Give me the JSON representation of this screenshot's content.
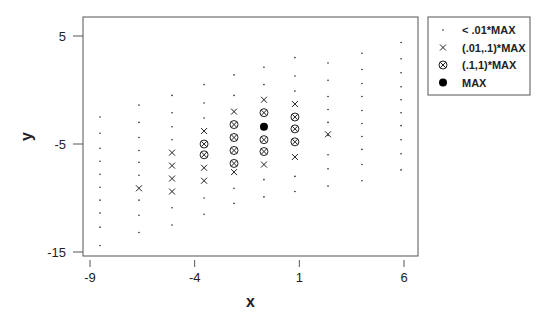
{
  "chart_data": {
    "type": "scatter",
    "title": "",
    "xlabel": "x",
    "ylabel": "y",
    "xlim": [
      -9.3,
      6.6
    ],
    "ylim": [
      -15.4,
      6.8
    ],
    "xticks": [
      -9,
      -4,
      1,
      6
    ],
    "yticks": [
      5,
      -5,
      -15
    ],
    "grid": false,
    "legend_position": "outside-top-right",
    "legend": [
      {
        "symbol": "dot",
        "label": "< .01*MAX"
      },
      {
        "symbol": "cross",
        "label": "(.01,.1)*MAX"
      },
      {
        "symbol": "circle-cross",
        "label": "(.1,1)*MAX"
      },
      {
        "symbol": "filled-circle",
        "label": "MAX"
      }
    ],
    "series": [
      {
        "name": "< .01*MAX",
        "symbol": "dot",
        "points": [
          [
            -8.52,
            -2.5
          ],
          [
            -8.52,
            -4.0
          ],
          [
            -8.52,
            -5.4
          ],
          [
            -8.52,
            -6.6
          ],
          [
            -8.52,
            -7.8
          ],
          [
            -8.52,
            -9.0
          ],
          [
            -8.52,
            -10.2
          ],
          [
            -8.52,
            -11.4
          ],
          [
            -8.52,
            -12.7
          ],
          [
            -8.52,
            -14.4
          ],
          [
            -6.66,
            -1.4
          ],
          [
            -6.66,
            -3.0
          ],
          [
            -6.66,
            -4.4
          ],
          [
            -6.66,
            -5.6
          ],
          [
            -6.66,
            -6.7
          ],
          [
            -6.66,
            -7.9
          ],
          [
            -6.66,
            -10.2
          ],
          [
            -6.66,
            -11.6
          ],
          [
            -6.66,
            -13.2
          ],
          [
            -5.08,
            -0.5
          ],
          [
            -5.08,
            -2.1
          ],
          [
            -5.08,
            -3.4
          ],
          [
            -5.08,
            -4.6
          ],
          [
            -5.08,
            -10.9
          ],
          [
            -5.08,
            -12.5
          ],
          [
            -3.55,
            0.5
          ],
          [
            -3.55,
            -1.2
          ],
          [
            -3.55,
            -2.6
          ],
          [
            -3.55,
            -10.0
          ],
          [
            -3.55,
            -11.5
          ],
          [
            -2.12,
            1.4
          ],
          [
            -2.12,
            -0.5
          ],
          [
            -2.12,
            -9.1
          ],
          [
            -2.12,
            -10.5
          ],
          [
            -0.69,
            2.1
          ],
          [
            -0.69,
            0.5
          ],
          [
            -0.69,
            -8.3
          ],
          [
            -0.69,
            -9.9
          ],
          [
            0.79,
            3.0
          ],
          [
            0.79,
            1.3
          ],
          [
            0.79,
            -0.1
          ],
          [
            0.79,
            -8.0
          ],
          [
            0.79,
            -9.4
          ],
          [
            2.37,
            2.5
          ],
          [
            2.37,
            0.9
          ],
          [
            2.37,
            -0.6
          ],
          [
            2.37,
            -1.8
          ],
          [
            2.37,
            -3.0
          ],
          [
            2.37,
            -4.2
          ],
          [
            2.37,
            -6.0
          ],
          [
            2.37,
            -7.3
          ],
          [
            2.37,
            -8.9
          ],
          [
            3.99,
            3.4
          ],
          [
            3.99,
            1.9
          ],
          [
            3.99,
            0.6
          ],
          [
            3.99,
            -0.6
          ],
          [
            3.99,
            -1.9
          ],
          [
            3.99,
            -3.1
          ],
          [
            3.99,
            -4.3
          ],
          [
            3.99,
            -5.5
          ],
          [
            3.99,
            -6.9
          ],
          [
            3.99,
            -8.4
          ],
          [
            5.86,
            4.4
          ],
          [
            5.86,
            2.9
          ],
          [
            5.86,
            1.6
          ],
          [
            5.86,
            0.3
          ],
          [
            5.86,
            -0.9
          ],
          [
            5.86,
            -2.1
          ],
          [
            5.86,
            -3.3
          ],
          [
            5.86,
            -4.6
          ],
          [
            5.86,
            -5.9
          ],
          [
            5.86,
            -7.4
          ]
        ]
      },
      {
        "name": "(.01,.1)*MAX",
        "symbol": "cross",
        "points": [
          [
            -6.66,
            -9.1
          ],
          [
            -5.08,
            -5.8
          ],
          [
            -5.08,
            -7.0
          ],
          [
            -5.08,
            -8.2
          ],
          [
            -5.08,
            -9.4
          ],
          [
            -3.55,
            -3.8
          ],
          [
            -3.55,
            -7.2
          ],
          [
            -3.55,
            -8.4
          ],
          [
            -2.12,
            -2.0
          ],
          [
            -2.12,
            -7.6
          ],
          [
            -0.69,
            -0.9
          ],
          [
            -0.69,
            -6.9
          ],
          [
            0.79,
            -1.3
          ],
          [
            0.79,
            -6.2
          ],
          [
            2.37,
            -4.1
          ]
        ]
      },
      {
        "name": "(.1,1)*MAX",
        "symbol": "circle-cross",
        "points": [
          [
            -3.55,
            -5.0
          ],
          [
            -3.55,
            -6.0
          ],
          [
            -2.12,
            -3.2
          ],
          [
            -2.12,
            -4.4
          ],
          [
            -2.12,
            -5.6
          ],
          [
            -2.12,
            -6.8
          ],
          [
            -0.69,
            -2.1
          ],
          [
            -0.69,
            -4.6
          ],
          [
            -0.69,
            -5.7
          ],
          [
            0.79,
            -2.5
          ],
          [
            0.79,
            -3.6
          ],
          [
            0.79,
            -4.8
          ]
        ]
      },
      {
        "name": "MAX",
        "symbol": "filled-circle",
        "points": [
          [
            -0.69,
            -3.4
          ]
        ]
      }
    ]
  },
  "plot_area": {
    "left": 83,
    "top": 17,
    "right": 418,
    "bottom": 256
  },
  "axis_pixels": {
    "x0_val": -9,
    "x0_px": 90,
    "x1_val": 6,
    "x1_px": 404,
    "y0_val": 5,
    "y0_px": 36,
    "y1_val": -15,
    "y1_px": 252
  },
  "legend_box": {
    "left": 428,
    "top": 17,
    "right": 530,
    "bottom": 95
  },
  "colors": {
    "ink": "#222222",
    "frame": "#555555",
    "background": "#ffffff"
  }
}
